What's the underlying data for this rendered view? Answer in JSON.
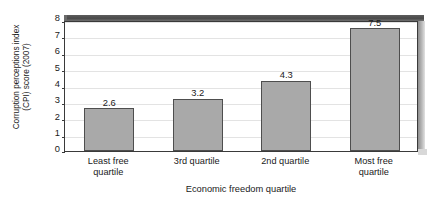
{
  "chart_data": {
    "type": "bar",
    "title": "",
    "subtitle": "",
    "xlabel": "Economic freedom quartile",
    "ylabel": "Corruption perceptions index (CPI) score (2007)",
    "ylabel_line1": "Corruption perceptions index",
    "ylabel_line2": "(CPI) score (2007)",
    "categories": [
      "Least free quartile",
      "3rd quartile",
      "2nd quartile",
      "Most free quartile"
    ],
    "category_lines": [
      [
        "Least free",
        "quartile"
      ],
      [
        "3rd quartile"
      ],
      [
        "2nd quartile"
      ],
      [
        "Most free",
        "quartile"
      ]
    ],
    "values": [
      2.6,
      3.2,
      4.3,
      7.5
    ],
    "value_labels": [
      "2.6",
      "3.2",
      "4.3",
      "7.5"
    ],
    "ylim": [
      0,
      8
    ],
    "yticks": [
      0,
      1,
      2,
      3,
      4,
      5,
      6,
      7,
      8
    ],
    "ytick_labels": [
      "0",
      "1",
      "2",
      "3",
      "4",
      "5",
      "6",
      "7",
      "8"
    ],
    "grid": true,
    "grid_axis": "y",
    "legend": false,
    "legend_position": "none",
    "colors": {
      "bar_fill": "#a9a9a9",
      "bar_edge": "#4e4e4e",
      "gridline": "#e3e3e3",
      "axis": "#3a3a3a",
      "plot_background": "#ffffff",
      "wall_top": "#4a4a4a",
      "wall_right": "#bdbdbd",
      "text": "#1a1a1a"
    }
  }
}
